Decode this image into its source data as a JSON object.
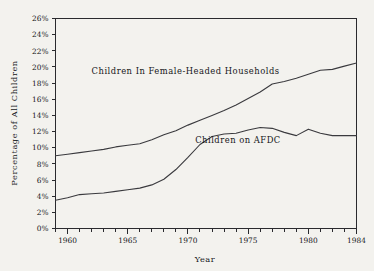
{
  "chart_data": {
    "type": "line",
    "title": "",
    "xlabel": "Year",
    "ylabel": "Percentage of All Children",
    "xlim": [
      1959,
      1984
    ],
    "ylim": [
      0,
      26
    ],
    "grid": false,
    "legend_position": "inline-labels",
    "y_tick_labels": [
      "0%",
      "2%",
      "4%",
      "6%",
      "8%",
      "10%",
      "12%",
      "14%",
      "16%",
      "18%",
      "20%",
      "22%",
      "24%",
      "26%"
    ],
    "y_ticks": [
      0,
      2,
      4,
      6,
      8,
      10,
      12,
      14,
      16,
      18,
      20,
      22,
      24,
      26
    ],
    "x_tick_labels": [
      "1960",
      "1965",
      "1970",
      "1975",
      "1980",
      "1984"
    ],
    "x_ticks": [
      1960,
      1965,
      1970,
      1975,
      1980,
      1984
    ],
    "x_minor_ticks": [
      1959,
      1961,
      1962,
      1963,
      1964,
      1966,
      1967,
      1968,
      1969,
      1971,
      1972,
      1973,
      1974,
      1976,
      1977,
      1978,
      1979,
      1981,
      1982,
      1983
    ],
    "x": [
      1959,
      1960,
      1961,
      1962,
      1963,
      1964,
      1965,
      1966,
      1967,
      1968,
      1969,
      1970,
      1971,
      1972,
      1973,
      1974,
      1975,
      1976,
      1977,
      1978,
      1979,
      1980,
      1981,
      1982,
      1983,
      1984
    ],
    "series": [
      {
        "name": "Children In Female-Headed Households",
        "label": "Children In Female-Headed Households",
        "label_x": 1962.0,
        "label_y": 19.1,
        "color": "#3a3a3e",
        "values": [
          9.0,
          9.2,
          9.4,
          9.6,
          9.8,
          10.1,
          10.3,
          10.5,
          11.0,
          11.6,
          12.1,
          12.8,
          13.4,
          14.0,
          14.6,
          15.3,
          16.1,
          16.9,
          17.9,
          18.2,
          18.6,
          19.1,
          19.6,
          19.7,
          20.1,
          20.5
        ]
      },
      {
        "name": "Children on AFDC",
        "label": "Children on AFDC",
        "label_x": 1970.6,
        "label_y": 10.6,
        "color": "#3a3a3e",
        "values": [
          3.5,
          3.8,
          4.2,
          4.3,
          4.4,
          4.6,
          4.8,
          5.0,
          5.4,
          6.1,
          7.3,
          8.8,
          10.4,
          11.4,
          11.7,
          11.8,
          12.2,
          12.5,
          12.4,
          11.9,
          11.5,
          12.3,
          11.8,
          11.5,
          11.5,
          11.5
        ]
      }
    ]
  }
}
